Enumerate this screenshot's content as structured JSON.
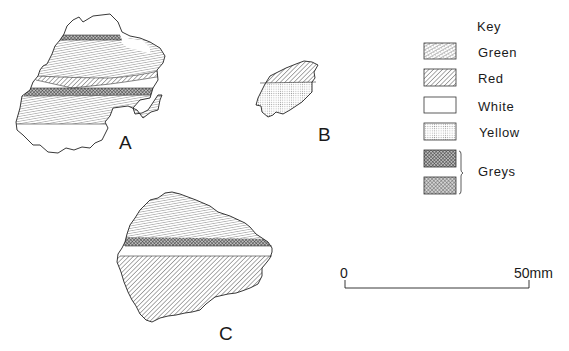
{
  "figure": {
    "sherds": [
      {
        "id": "A",
        "label": "A"
      },
      {
        "id": "B",
        "label": "B"
      },
      {
        "id": "C",
        "label": "C"
      }
    ]
  },
  "key": {
    "title": "Key",
    "items": [
      {
        "label": "Green",
        "pattern": "stipple-diag"
      },
      {
        "label": "Red",
        "pattern": "diagonal-hatch"
      },
      {
        "label": "White",
        "pattern": "blank"
      },
      {
        "label": "Yellow",
        "pattern": "fine-dots"
      },
      {
        "label": "",
        "pattern": "dark-crosshatch"
      },
      {
        "label": "",
        "pattern": "medium-crosshatch"
      }
    ],
    "group_label": "Greys"
  },
  "scale": {
    "start": "0",
    "end": "50mm"
  },
  "colors": {
    "ink": "#1a1a1a",
    "background": "#ffffff"
  }
}
